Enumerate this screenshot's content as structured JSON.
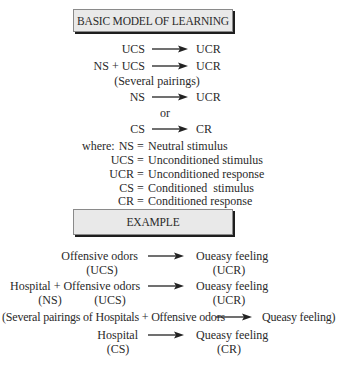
{
  "basic_model": {
    "title": "BASIC MODEL OF LEARNING",
    "rows": [
      {
        "left": "UCS",
        "right": "UCR"
      },
      {
        "left": "NS + UCS",
        "right": "UCR"
      },
      {
        "note": "(Several pairings)"
      },
      {
        "left": "NS",
        "right": "UCR"
      },
      {
        "note": "or"
      },
      {
        "left": "CS",
        "right": "CR"
      }
    ],
    "where_label": "where:",
    "definitions": [
      {
        "term": "NS",
        "definition": "Neutral stimulus"
      },
      {
        "term": "UCS",
        "definition": "Unconditioned stimulus"
      },
      {
        "term": "UCR",
        "definition": "Unconditioned response"
      },
      {
        "term": "CS",
        "definition": "Conditioned  stimulus"
      },
      {
        "term": "CR",
        "definition": "Conditioned response"
      }
    ]
  },
  "example": {
    "title": "EXAMPLE",
    "rows": [
      {
        "left": "Offensive odors",
        "left_tag": "(UCS)",
        "right": "Oueasy feeling",
        "right_tag": "(UCR)"
      },
      {
        "left": "Hospital + Offensive odors",
        "left_tag_1": "(NS)",
        "left_tag_2": "(UCS)",
        "right": "Oueasy feeling",
        "right_tag": "(UCR)"
      },
      {
        "left": "(Several pairings of Hospitals + Offensive odors",
        "right": "Queasy feeling)"
      },
      {
        "left": "Hospital",
        "left_tag": "(CS)",
        "right": "Queasy feeling",
        "right_tag": "(CR)"
      }
    ]
  },
  "arrow_symbol": "right-arrow",
  "colors": {
    "box_fill": "#e9e9e9",
    "box_shadow": "#1e1e1e",
    "text": "#2a2a2a"
  }
}
